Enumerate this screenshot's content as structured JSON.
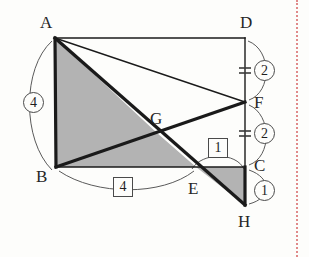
{
  "figure": {
    "background_color": "#fdfdfb",
    "stroke_color": "#1a1a1a",
    "shade_color": "#b3b3b3",
    "arc_color": "#5a5a5a",
    "page_edge_color": "#e08a8a"
  },
  "vertices": [
    {
      "id": "A",
      "label": "A",
      "x": 55,
      "y": 38,
      "label_x": 40,
      "label_y": 14
    },
    {
      "id": "D",
      "label": "D",
      "x": 245,
      "y": 38,
      "label_x": 240,
      "label_y": 14
    },
    {
      "id": "F",
      "label": "F",
      "x": 245,
      "y": 102,
      "label_x": 254,
      "label_y": 94
    },
    {
      "id": "G",
      "label": "G",
      "x": 157,
      "y": 133,
      "label_x": 150,
      "label_y": 110
    },
    {
      "id": "C",
      "label": "C",
      "x": 245,
      "y": 167,
      "label_x": 254,
      "label_y": 157
    },
    {
      "id": "B",
      "label": "B",
      "x": 56,
      "y": 167,
      "label_x": 36,
      "label_y": 168
    },
    {
      "id": "E",
      "label": "E",
      "x": 196,
      "y": 167,
      "label_x": 188,
      "label_y": 180
    },
    {
      "id": "H",
      "label": "H",
      "x": 245,
      "y": 205,
      "label_x": 238,
      "label_y": 213
    }
  ],
  "shaded_regions": [
    {
      "name": "quad-ABEG",
      "points": "55,38 56,167 196,167 157,133"
    },
    {
      "name": "triangle-ECH",
      "points": "196,167 245,167 245,205"
    }
  ],
  "segments": [
    {
      "name": "side-AD",
      "from": "A",
      "to": "D",
      "weight": "thin"
    },
    {
      "name": "side-AB",
      "from": "A",
      "to": "B",
      "weight": "thick"
    },
    {
      "name": "side-BC",
      "from": "B",
      "to": "C",
      "weight": "thin"
    },
    {
      "name": "side-DC",
      "from": "D",
      "to": "C",
      "weight": "thin"
    },
    {
      "name": "segment-CH",
      "from": "C",
      "to": "H",
      "weight": "thick"
    },
    {
      "name": "diagonal-AF",
      "from": "A",
      "to": "F",
      "weight": "thin"
    },
    {
      "name": "diagonal-AH",
      "from": "A",
      "to": "H",
      "weight": "thick"
    },
    {
      "name": "diagonal-BF",
      "from": "B",
      "to": "F",
      "weight": "thick"
    }
  ],
  "measures": [
    {
      "name": "measure-AB",
      "value": "4",
      "style": "circle",
      "x": 23,
      "y": 92,
      "side": "left"
    },
    {
      "name": "measure-BE",
      "value": "4",
      "style": "box",
      "x": 113,
      "y": 177,
      "side": "bottom"
    },
    {
      "name": "measure-DF",
      "value": "2",
      "style": "circle",
      "x": 254,
      "y": 60,
      "side": "right"
    },
    {
      "name": "measure-FC",
      "value": "2",
      "style": "circle",
      "x": 254,
      "y": 123,
      "side": "right"
    },
    {
      "name": "measure-CH",
      "value": "1",
      "style": "circle",
      "x": 254,
      "y": 180,
      "side": "right"
    },
    {
      "name": "measure-EC",
      "value": "1",
      "style": "box",
      "x": 208,
      "y": 138,
      "side": "top"
    }
  ],
  "arcs": [
    {
      "name": "arc-AB",
      "d": "M 52,41 C 22,68 22,140 52,170"
    },
    {
      "name": "arc-BE",
      "d": "M 59,171 C 96,196 162,196 194,171"
    },
    {
      "name": "arc-DF",
      "d": "M 248,41 C 272,50 272,92 249,100"
    },
    {
      "name": "arc-FC",
      "d": "M 249,105 C 272,115 272,157 249,165"
    },
    {
      "name": "arc-CH",
      "d": "M 249,170 C 272,178 272,198 249,204"
    },
    {
      "name": "arc-EC",
      "d": "M 192,169 C 202,152 236,152 244,169"
    }
  ],
  "tick_marks": [
    {
      "name": "tick-DF",
      "x1": 239,
      "y1": 68,
      "x2": 251,
      "y2": 68
    },
    {
      "name": "tick-DF2",
      "x1": 239,
      "y1": 73,
      "x2": 251,
      "y2": 73
    },
    {
      "name": "tick-FC",
      "x1": 239,
      "y1": 131,
      "x2": 251,
      "y2": 131
    },
    {
      "name": "tick-FC2",
      "x1": 239,
      "y1": 136,
      "x2": 251,
      "y2": 136
    }
  ]
}
